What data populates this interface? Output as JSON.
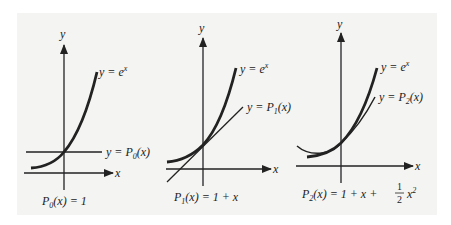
{
  "figure": {
    "panels": [
      {
        "id": "P0",
        "y_axis_label": "y",
        "x_axis_label": "x",
        "curve_label": "y = e",
        "curve_label_sup": "x",
        "approx_label_prefix": "y = P",
        "approx_label_sub": "0",
        "approx_label_suffix": "(x)",
        "caption_prefix": "P",
        "caption_sub": "0",
        "caption_rest": "(x) = 1"
      },
      {
        "id": "P1",
        "y_axis_label": "y",
        "x_axis_label": "x",
        "curve_label": "y = e",
        "curve_label_sup": "x",
        "approx_label_prefix": "y = P",
        "approx_label_sub": "1",
        "approx_label_suffix": "(x)",
        "caption_prefix": "P",
        "caption_sub": "1",
        "caption_rest": "(x) = 1 + x"
      },
      {
        "id": "P2",
        "y_axis_label": "y",
        "x_axis_label": "x",
        "curve_label": "y = e",
        "curve_label_sup": "x",
        "approx_label_prefix": "y = P",
        "approx_label_sub": "2",
        "approx_label_suffix": "(x)",
        "caption_prefix": "P",
        "caption_sub": "2",
        "caption_rest": "(x) = 1 + x + ",
        "caption_frac_num": "1",
        "caption_frac_den": "2",
        "caption_tail": "x",
        "caption_tail_sup": "2"
      }
    ]
  }
}
